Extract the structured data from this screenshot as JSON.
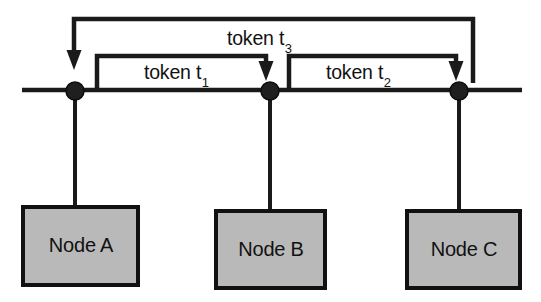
{
  "diagram": {
    "colors": {
      "line": "#1a1a1a",
      "node_fill": "#b9b9b9",
      "node_border": "#111111",
      "background": "#ffffff",
      "text": "#111111"
    },
    "bus": {
      "name": "bus-line",
      "y": 90,
      "x_start": 22,
      "x_end": 522,
      "thickness": 4
    },
    "taps": [
      {
        "id": "tap-a",
        "x": 75,
        "y": 91,
        "radius": 9
      },
      {
        "id": "tap-b",
        "x": 270,
        "y": 91,
        "radius": 9
      },
      {
        "id": "tap-c",
        "x": 459,
        "y": 91,
        "radius": 9
      }
    ],
    "nodes": [
      {
        "id": "node-a",
        "label": "Node A",
        "box": {
          "x": 23,
          "y": 207,
          "w": 115,
          "h": 78
        },
        "drop_x": 75
      },
      {
        "id": "node-b",
        "label": "Node B",
        "box": {
          "x": 216,
          "y": 211,
          "w": 109,
          "h": 77
        },
        "drop_x": 270
      },
      {
        "id": "node-c",
        "label": "Node C",
        "box": {
          "x": 407,
          "y": 211,
          "w": 113,
          "h": 77
        },
        "drop_x": 459
      }
    ],
    "tokens": [
      {
        "id": "token-t1",
        "text": "token t",
        "subscript": "1",
        "from": "Node A",
        "to": "Node B",
        "bracket": {
          "x_start": 97,
          "x_end": 266,
          "top_y": 56,
          "tail_y": 90,
          "arrow_y": 80
        }
      },
      {
        "id": "token-t2",
        "text": "token t",
        "subscript": "2",
        "from": "Node B",
        "to": "Node C",
        "bracket": {
          "x_start": 289,
          "x_end": 456,
          "top_y": 56,
          "tail_y": 90,
          "arrow_y": 80
        }
      },
      {
        "id": "token-t3",
        "text": "token t",
        "subscript": "3",
        "from": "Node C",
        "to": "Node A",
        "bracket": {
          "x_start": 473,
          "x_end": 74,
          "top_y": 19,
          "tail_y": 83,
          "arrow_y": 68
        }
      }
    ]
  }
}
